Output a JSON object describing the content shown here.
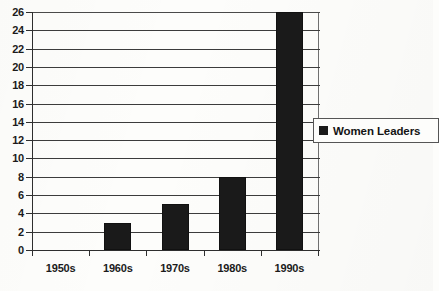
{
  "chart_data": {
    "type": "bar",
    "title": "",
    "subtitle": "",
    "xlabel": "",
    "ylabel": "",
    "categories": [
      "1950s",
      "1960s",
      "1970s",
      "1980s",
      "1990s"
    ],
    "values": [
      0,
      3,
      5,
      8,
      26
    ],
    "series": [
      {
        "name": "Women Leaders",
        "values": [
          0,
          3,
          5,
          8,
          26
        ],
        "color": "#1a1a1a"
      }
    ],
    "ylim": [
      0,
      26
    ],
    "ytick_step": 2,
    "yticks": [
      0,
      2,
      4,
      6,
      8,
      10,
      12,
      14,
      16,
      18,
      20,
      22,
      24,
      26
    ],
    "ytick_labels": [
      "0",
      "2",
      "4",
      "6",
      "8",
      "10",
      "12",
      "14",
      "16",
      "18",
      "20",
      "22",
      "24",
      "26"
    ],
    "grid": true,
    "grid_axis": "y",
    "legend": {
      "position": "right",
      "entries": [
        {
          "label": "Women Leaders",
          "color": "#1a1a1a",
          "marker": "square"
        }
      ]
    },
    "colors": {
      "bar": "#1a1a1a",
      "grid": "#3c3c3c",
      "axis": "#2e2e2e",
      "text": "#1b1b1b",
      "background": "#fdfdfb",
      "legend_border": "#555555"
    }
  }
}
